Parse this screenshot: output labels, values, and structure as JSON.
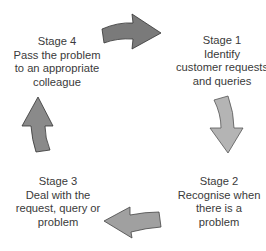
{
  "diagram": {
    "type": "cycle",
    "stages": [
      {
        "title": "Stage 1",
        "lines": [
          "Identify",
          "customer requests",
          "and queries"
        ]
      },
      {
        "title": "Stage 2",
        "lines": [
          "Recognise when",
          "there is a",
          "problem"
        ]
      },
      {
        "title": "Stage 3",
        "lines": [
          "Deal with the",
          "request, query or",
          "problem"
        ]
      },
      {
        "title": "Stage 4",
        "lines": [
          "Pass the problem",
          "to an appropriate",
          "colleague"
        ]
      }
    ],
    "arrows": [
      {
        "from": "Stage 4",
        "to": "Stage 1",
        "direction": "right",
        "color": "#7a7a7a"
      },
      {
        "from": "Stage 1",
        "to": "Stage 2",
        "direction": "down",
        "color": "#b4b4b4"
      },
      {
        "from": "Stage 2",
        "to": "Stage 3",
        "direction": "left",
        "color": "#a0a0a0"
      },
      {
        "from": "Stage 3",
        "to": "Stage 4",
        "direction": "up",
        "color": "#8a8a8a"
      }
    ]
  }
}
